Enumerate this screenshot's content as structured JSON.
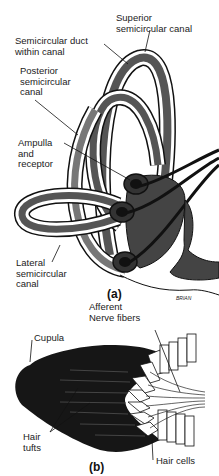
{
  "figure": {
    "panel_a": {
      "caption": "(a)",
      "labels": {
        "superior_1": "Superior",
        "superior_2": "semicircular canal",
        "duct_1": "Semicircular duct",
        "duct_2": "within canal",
        "posterior_1": "Posterior",
        "posterior_2": "semicircular",
        "posterior_3": "canal",
        "ampulla_1": "Ampulla",
        "ampulla_2": "and",
        "ampulla_3": "receptor",
        "lateral_1": "Lateral",
        "lateral_2": "semicircular",
        "lateral_3": "canal"
      },
      "signature": "BRIAN"
    },
    "panel_b": {
      "caption": "(b)",
      "labels": {
        "afferent_1": "Afferent",
        "afferent_2": "Nerve fibers",
        "cupula": "Cupula",
        "hair_tufts_1": "Hair",
        "hair_tufts_2": "tufts",
        "hair_cells": "Hair cells"
      }
    },
    "colors": {
      "duct": "#555555",
      "outline": "#111111",
      "cupula": "#161616",
      "background": "#ffffff"
    }
  }
}
